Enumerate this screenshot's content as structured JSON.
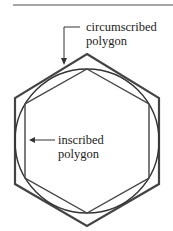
{
  "labels": {
    "circumscribed_line1": "circumscribed",
    "circumscribed_line2": "polygon",
    "inscribed_line1": "inscribed",
    "inscribed_line2": "polygon"
  },
  "colors": {
    "stroke": "#333333",
    "rule": "#888888",
    "text": "#222222"
  }
}
